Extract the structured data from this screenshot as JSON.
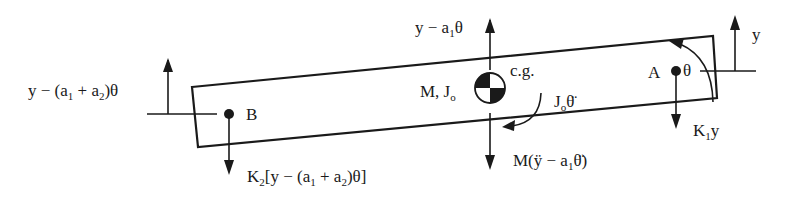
{
  "diagram": {
    "type": "free-body diagram",
    "colors": {
      "ink": "#1a1a1a",
      "background": "#ffffff"
    },
    "body": {
      "label_mass": "M, J",
      "label_mass_sub": "o",
      "cg_label": "c.g."
    },
    "points": {
      "A": {
        "label": "A"
      },
      "B": {
        "label": "B"
      }
    },
    "displacements": {
      "left": {
        "text_pre": "y − (a",
        "s1": "1",
        "mid": " + a",
        "s2": "2",
        "post": ")θ"
      },
      "center": {
        "text_pre": "y − a",
        "s1": "1",
        "post": "θ"
      },
      "right": {
        "text": "y"
      },
      "rotation": {
        "text": "θ"
      }
    },
    "forces": {
      "spring_B": {
        "pre": "K",
        "s": "2",
        "post": "[y − (a",
        "s1": "1",
        "mid": " + a",
        "s2": "2",
        "end": ")θ]"
      },
      "spring_A": {
        "pre": "K",
        "s": "1",
        "post": "y"
      },
      "inertia_force": {
        "pre": "M(ÿ − a",
        "s1": "1",
        "post": "θ̈)"
      },
      "inertia_moment": {
        "pre": "J",
        "s": "o",
        "post": "θ̈"
      }
    }
  }
}
